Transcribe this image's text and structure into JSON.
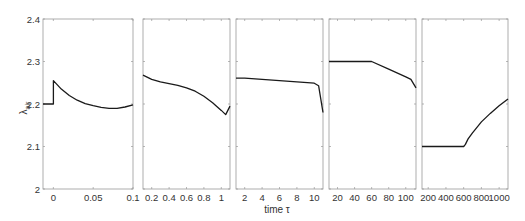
{
  "chart_data": {
    "type": "line",
    "layout": "5 horizontally adjacent subplots sharing a y-axis",
    "xlabel": "time τ",
    "ylabel": "λ_air",
    "ylabel_main": "λ",
    "ylabel_sub": "air",
    "ylim": [
      2.0,
      2.4
    ],
    "yticks": [
      2,
      2.1,
      2.2,
      2.3,
      2.4
    ],
    "ytick_labels": [
      "2",
      "2.1",
      "2.2",
      "2.3",
      "2.4"
    ],
    "grid": false,
    "legend": null,
    "colors": {
      "line": "#1a1a1a",
      "axes": "#9a9a9a",
      "text": "#333333"
    },
    "panels": [
      {
        "xlim": [
          -0.013,
          0.1
        ],
        "xticks": [
          0,
          0.05,
          0.1
        ],
        "xtick_labels": [
          "0",
          "0.05",
          "0.1"
        ],
        "x": [
          -0.013,
          0,
          0,
          0.01,
          0.02,
          0.03,
          0.04,
          0.05,
          0.06,
          0.07,
          0.08,
          0.09,
          0.1
        ],
        "y": [
          2.2,
          2.2,
          2.255,
          2.235,
          2.22,
          2.209,
          2.201,
          2.196,
          2.192,
          2.19,
          2.19,
          2.193,
          2.198
        ]
      },
      {
        "xlim": [
          0.1,
          1.1
        ],
        "xticks": [
          0.2,
          0.4,
          0.6,
          0.8,
          1
        ],
        "xtick_labels": [
          "0.2",
          "0.4",
          "0.6",
          "0.8",
          "1"
        ],
        "x": [
          0.1,
          0.2,
          0.3,
          0.4,
          0.5,
          0.6,
          0.7,
          0.8,
          0.9,
          1.0,
          1.05,
          1.1
        ],
        "y": [
          2.268,
          2.258,
          2.252,
          2.248,
          2.244,
          2.238,
          2.23,
          2.218,
          2.203,
          2.185,
          2.175,
          2.195
        ]
      },
      {
        "xlim": [
          1,
          11
        ],
        "xticks": [
          2,
          4,
          6,
          8,
          10
        ],
        "xtick_labels": [
          "2",
          "4",
          "6",
          "8",
          "10"
        ],
        "x": [
          1,
          2,
          4,
          6,
          8,
          10,
          10.5,
          11
        ],
        "y": [
          2.261,
          2.261,
          2.258,
          2.255,
          2.252,
          2.249,
          2.243,
          2.18
        ]
      },
      {
        "xlim": [
          10,
          112
        ],
        "xticks": [
          20,
          40,
          60,
          80,
          100
        ],
        "xtick_labels": [
          "20",
          "40",
          "60",
          "80",
          "100"
        ],
        "x": [
          10,
          20,
          40,
          60,
          80,
          100,
          106,
          112
        ],
        "y": [
          2.3,
          2.3,
          2.3,
          2.3,
          2.282,
          2.264,
          2.258,
          2.238
        ]
      },
      {
        "xlim": [
          130,
          1100
        ],
        "xticks": [
          200,
          400,
          600,
          800,
          1000
        ],
        "xtick_labels": [
          "200",
          "400",
          "600",
          "800",
          "1000"
        ],
        "x": [
          130,
          200,
          400,
          600,
          620,
          650,
          700,
          800,
          900,
          1000,
          1100
        ],
        "y": [
          2.1,
          2.1,
          2.1,
          2.1,
          2.105,
          2.118,
          2.132,
          2.158,
          2.178,
          2.196,
          2.212
        ]
      }
    ]
  }
}
